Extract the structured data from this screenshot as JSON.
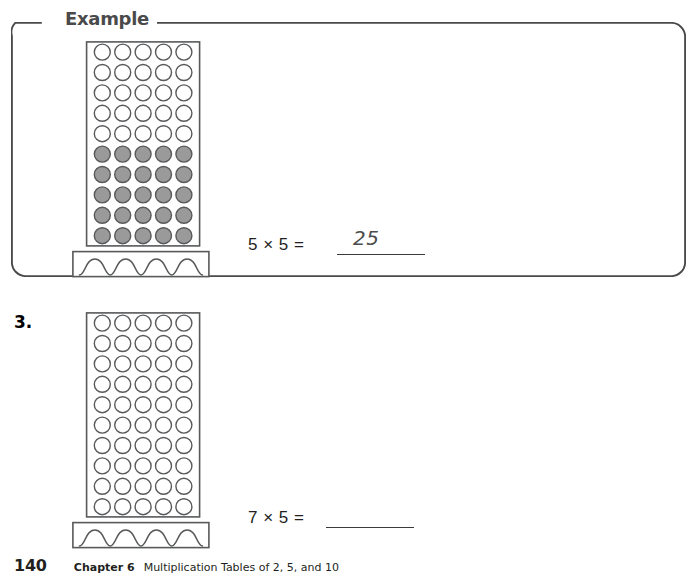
{
  "page": {
    "width": 697,
    "height": 586,
    "background": "#ffffff"
  },
  "example_box": {
    "label": "Example",
    "border_color": "#4a4a4a",
    "corner_radius": 14,
    "x": 11,
    "y": 22,
    "width": 675,
    "height": 255
  },
  "figures": [
    {
      "id": "example-grater",
      "type": "grater-array",
      "x": 72,
      "y": 41,
      "grid": {
        "x": 86,
        "y": 41,
        "columns": 5,
        "rows": 10,
        "cell": 20.4,
        "circle_diameter": 16,
        "filled_rows": 5,
        "empty_rows": 5,
        "fill_color": "#9a9a9a",
        "outline_color": "#58595b",
        "frame_color": "#58595b"
      },
      "base": {
        "x": 72,
        "y": 251,
        "width": 136,
        "height": 26,
        "arches": 4,
        "outline_color": "#58595b"
      }
    },
    {
      "id": "problem3-grater",
      "type": "grater-array",
      "x": 72,
      "y": 312,
      "grid": {
        "x": 86,
        "y": 312,
        "columns": 5,
        "rows": 10,
        "cell": 20.4,
        "circle_diameter": 16,
        "filled_rows": 0,
        "empty_rows": 10,
        "fill_color": "#ffffff",
        "outline_color": "#58595b",
        "frame_color": "#58595b"
      },
      "base": {
        "x": 72,
        "y": 518,
        "width": 136,
        "height": 26,
        "arches": 4,
        "outline_color": "#58595b"
      }
    }
  ],
  "problems": [
    {
      "number": "",
      "equation_text": "5  × 5 =",
      "answer": "25",
      "answer_filled": true,
      "eq_x": 248,
      "eq_y": 235,
      "blank_x": 337,
      "blank_y": 254,
      "blank_width": 88,
      "answer_x": 353,
      "answer_y": 226
    },
    {
      "number": "3.",
      "number_x": 14,
      "number_y": 312,
      "equation_text": "7 × 5 =",
      "answer": "",
      "answer_filled": false,
      "eq_x": 248,
      "eq_y": 508,
      "blank_x": 326,
      "blank_y": 527,
      "blank_width": 88,
      "answer_x": 342,
      "answer_y": 499
    }
  ],
  "footer": {
    "page_number": "140",
    "chapter": "Chapter 6",
    "chapter_title": "Multiplication Tables of 2, 5, and 10"
  }
}
